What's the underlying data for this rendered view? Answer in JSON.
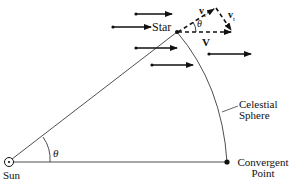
{
  "diagram": {
    "labels": {
      "star": "Star",
      "sun": "Sun",
      "theta_sun": "θ",
      "theta_star": "θ",
      "celestial_line1": "Celestial",
      "celestial_line2": "Sphere",
      "convergent_line1": "Convergent",
      "convergent_line2": "Point",
      "v_r": "v",
      "v_r_sub": "r",
      "v_t": "v",
      "v_t_sub": "t",
      "V": "V"
    },
    "colors": {
      "ink": "#111111",
      "background": "#ffffff"
    }
  }
}
